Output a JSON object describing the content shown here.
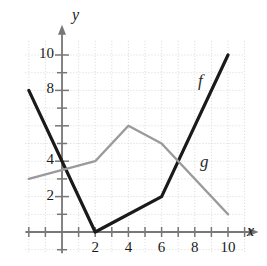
{
  "chart_data": {
    "type": "line",
    "title": "",
    "xlabel": "x",
    "ylabel": "y",
    "xlim": [
      -2.2,
      11.0
    ],
    "ylim": [
      -1.2,
      10.8
    ],
    "grid": true,
    "grid_step": 1,
    "legend_position": "inline-curve-labels",
    "xticks": [
      2,
      4,
      6,
      8,
      10
    ],
    "xtick_labels": [
      "2",
      "4",
      "6",
      "8",
      "10"
    ],
    "yticks": [
      2,
      4,
      8,
      10
    ],
    "ytick_labels": [
      "2",
      "4",
      "8",
      "10"
    ],
    "series": [
      {
        "name": "f",
        "label": "f",
        "color": "#1a1a1a",
        "width": 3.2,
        "points": [
          [
            -2,
            8
          ],
          [
            2,
            0
          ],
          [
            6,
            2
          ],
          [
            10,
            10
          ]
        ]
      },
      {
        "name": "g",
        "label": "g",
        "color": "#9a9a9a",
        "width": 2.4,
        "points": [
          [
            -2,
            3
          ],
          [
            2,
            4
          ],
          [
            4,
            6
          ],
          [
            6,
            5
          ],
          [
            10,
            1
          ]
        ]
      }
    ],
    "annotations": [
      {
        "text": "f",
        "x": 8.6,
        "y": 7.1
      },
      {
        "text": "g",
        "x": 8.7,
        "y": 2.9
      }
    ]
  },
  "axis": {
    "x_axis_label": "x",
    "y_axis_label": "y"
  },
  "colors": {
    "grid": "#d8d8d8",
    "axis": "#777777",
    "f_curve": "#1a1a1a",
    "g_curve": "#9a9a9a",
    "text": "#1a1a1a",
    "background": "#ffffff"
  }
}
